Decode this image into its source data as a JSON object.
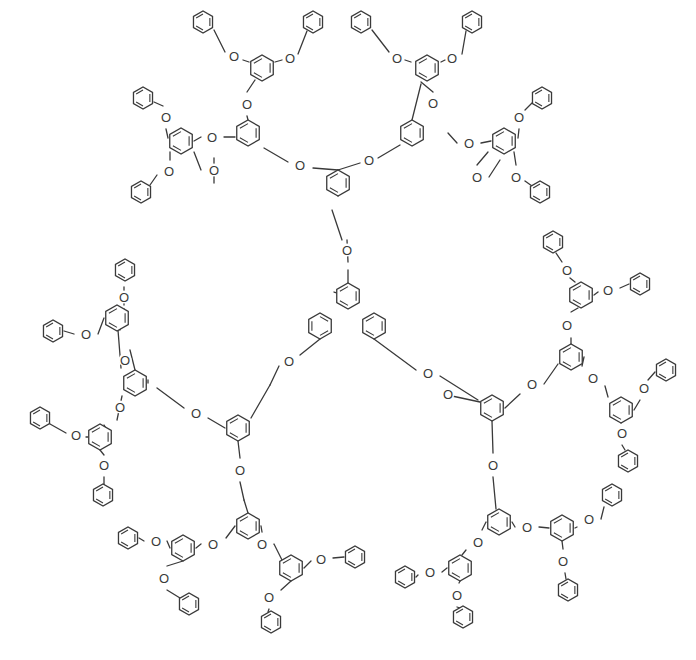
{
  "figure": {
    "type": "chemical-structure",
    "core": {
      "label": "",
      "methyl_tick": true
    },
    "atom_label": "O",
    "caption": "",
    "colors": {
      "line": "#3a3a3a",
      "background": "#ffffff"
    }
  },
  "rings": [
    {
      "id": "core1",
      "x": 348,
      "y": 296,
      "r": 13,
      "rot": 90
    },
    {
      "id": "core2",
      "x": 320,
      "y": 326,
      "r": 13,
      "rot": 30
    },
    {
      "id": "core3",
      "x": 374,
      "y": 326,
      "r": 13,
      "rot": -30
    },
    {
      "id": "G1a",
      "x": 338,
      "y": 183,
      "r": 13,
      "rot": 90
    },
    {
      "id": "G2a1",
      "x": 248,
      "y": 133,
      "r": 13,
      "rot": 90
    },
    {
      "id": "G2a2",
      "x": 412,
      "y": 133,
      "r": 13,
      "rot": 90
    },
    {
      "id": "G3a1",
      "x": 262,
      "y": 68,
      "r": 13,
      "rot": 90
    },
    {
      "id": "G3a2",
      "x": 181,
      "y": 141,
      "r": 13,
      "rot": 90
    },
    {
      "id": "G3a3",
      "x": 427,
      "y": 68,
      "r": 13,
      "rot": 90
    },
    {
      "id": "G3a4",
      "x": 504,
      "y": 141,
      "r": 13,
      "rot": 90
    },
    {
      "id": "Pa1",
      "x": 203,
      "y": 22,
      "r": 11,
      "rot": 90
    },
    {
      "id": "Pa2",
      "x": 313,
      "y": 22,
      "r": 11,
      "rot": 90
    },
    {
      "id": "Pa3",
      "x": 143,
      "y": 98,
      "r": 11,
      "rot": 90
    },
    {
      "id": "Pa4",
      "x": 141,
      "y": 192,
      "r": 11,
      "rot": 90
    },
    {
      "id": "Pa5",
      "x": 361,
      "y": 22,
      "r": 11,
      "rot": 90
    },
    {
      "id": "Pa6",
      "x": 472,
      "y": 22,
      "r": 11,
      "rot": 90
    },
    {
      "id": "Pa7",
      "x": 542,
      "y": 98,
      "r": 11,
      "rot": 90
    },
    {
      "id": "Pa8",
      "x": 540,
      "y": 192,
      "r": 11,
      "rot": 90
    },
    {
      "id": "G1b",
      "x": 238,
      "y": 428,
      "r": 13,
      "rot": 90
    },
    {
      "id": "G2b1",
      "x": 135,
      "y": 383,
      "r": 13,
      "rot": 90
    },
    {
      "id": "G2b2",
      "x": 248,
      "y": 526,
      "r": 13,
      "rot": 90
    },
    {
      "id": "G3b1",
      "x": 117,
      "y": 318,
      "r": 13,
      "rot": 90
    },
    {
      "id": "G3b2",
      "x": 100,
      "y": 437,
      "r": 13,
      "rot": 90
    },
    {
      "id": "G3b3",
      "x": 183,
      "y": 548,
      "r": 13,
      "rot": 90
    },
    {
      "id": "G3b4",
      "x": 291,
      "y": 568,
      "r": 13,
      "rot": 90
    },
    {
      "id": "Pb1",
      "x": 125,
      "y": 270,
      "r": 11,
      "rot": 90
    },
    {
      "id": "Pb2",
      "x": 53,
      "y": 331,
      "r": 11,
      "rot": 90
    },
    {
      "id": "Pb3",
      "x": 40,
      "y": 418,
      "r": 11,
      "rot": 90
    },
    {
      "id": "Pb4",
      "x": 103,
      "y": 495,
      "r": 11,
      "rot": 90
    },
    {
      "id": "Pb5",
      "x": 128,
      "y": 538,
      "r": 11,
      "rot": 90
    },
    {
      "id": "Pb6",
      "x": 189,
      "y": 604,
      "r": 11,
      "rot": 90
    },
    {
      "id": "Pb7",
      "x": 355,
      "y": 557,
      "r": 11,
      "rot": 90
    },
    {
      "id": "Pb8",
      "x": 271,
      "y": 622,
      "r": 11,
      "rot": 90
    },
    {
      "id": "G1c",
      "x": 492,
      "y": 408,
      "r": 13,
      "rot": 90
    },
    {
      "id": "G2c1",
      "x": 571,
      "y": 357,
      "r": 13,
      "rot": 90
    },
    {
      "id": "G2c2",
      "x": 499,
      "y": 522,
      "r": 13,
      "rot": 90
    },
    {
      "id": "G3c1",
      "x": 581,
      "y": 295,
      "r": 13,
      "rot": 90
    },
    {
      "id": "G3c2",
      "x": 621,
      "y": 410,
      "r": 13,
      "rot": 90
    },
    {
      "id": "G3c3",
      "x": 460,
      "y": 568,
      "r": 13,
      "rot": 90
    },
    {
      "id": "G3c4",
      "x": 562,
      "y": 528,
      "r": 13,
      "rot": 90
    },
    {
      "id": "Pc1",
      "x": 553,
      "y": 242,
      "r": 11,
      "rot": 90
    },
    {
      "id": "Pc2",
      "x": 640,
      "y": 284,
      "r": 11,
      "rot": 90
    },
    {
      "id": "Pc3",
      "x": 666,
      "y": 370,
      "r": 11,
      "rot": 90
    },
    {
      "id": "Pc4",
      "x": 628,
      "y": 461,
      "r": 11,
      "rot": 90
    },
    {
      "id": "Pc5",
      "x": 405,
      "y": 577,
      "r": 11,
      "rot": 90
    },
    {
      "id": "Pc6",
      "x": 463,
      "y": 617,
      "r": 11,
      "rot": 90
    },
    {
      "id": "Pc7",
      "x": 612,
      "y": 495,
      "r": 11,
      "rot": 90
    },
    {
      "id": "Pc8",
      "x": 568,
      "y": 590,
      "r": 11,
      "rot": 90
    }
  ],
  "oxygens": [
    {
      "x": 347,
      "y": 250
    },
    {
      "x": 289,
      "y": 361
    },
    {
      "x": 428,
      "y": 373
    },
    {
      "x": 300,
      "y": 165
    },
    {
      "x": 369,
      "y": 160
    },
    {
      "x": 247,
      "y": 104
    },
    {
      "x": 433,
      "y": 103
    },
    {
      "x": 212,
      "y": 137
    },
    {
      "x": 214,
      "y": 170
    },
    {
      "x": 469,
      "y": 143
    },
    {
      "x": 477,
      "y": 177
    },
    {
      "x": 234,
      "y": 56
    },
    {
      "x": 290,
      "y": 58
    },
    {
      "x": 166,
      "y": 117
    },
    {
      "x": 169,
      "y": 171
    },
    {
      "x": 397,
      "y": 58
    },
    {
      "x": 452,
      "y": 58
    },
    {
      "x": 519,
      "y": 117
    },
    {
      "x": 516,
      "y": 177
    },
    {
      "x": 196,
      "y": 413
    },
    {
      "x": 240,
      "y": 470
    },
    {
      "x": 125,
      "y": 360
    },
    {
      "x": 120,
      "y": 407
    },
    {
      "x": 213,
      "y": 544
    },
    {
      "x": 262,
      "y": 544
    },
    {
      "x": 124,
      "y": 297
    },
    {
      "x": 86,
      "y": 334
    },
    {
      "x": 76,
      "y": 435
    },
    {
      "x": 104,
      "y": 465
    },
    {
      "x": 156,
      "y": 541
    },
    {
      "x": 164,
      "y": 578
    },
    {
      "x": 321,
      "y": 559
    },
    {
      "x": 269,
      "y": 597
    },
    {
      "x": 448,
      "y": 394
    },
    {
      "x": 532,
      "y": 384
    },
    {
      "x": 493,
      "y": 465
    },
    {
      "x": 567,
      "y": 325
    },
    {
      "x": 593,
      "y": 378
    },
    {
      "x": 478,
      "y": 542
    },
    {
      "x": 527,
      "y": 527
    },
    {
      "x": 567,
      "y": 270
    },
    {
      "x": 608,
      "y": 290
    },
    {
      "x": 644,
      "y": 388
    },
    {
      "x": 622,
      "y": 433
    },
    {
      "x": 430,
      "y": 572
    },
    {
      "x": 457,
      "y": 595
    },
    {
      "x": 589,
      "y": 519
    },
    {
      "x": 563,
      "y": 561
    }
  ],
  "bonds": [
    [
      348,
      283,
      348,
      270
    ],
    [
      348,
      262,
      347,
      240
    ],
    [
      342,
      240,
      332,
      210
    ],
    [
      338,
      196,
      338,
      170
    ],
    [
      338,
      170,
      313,
      168
    ],
    [
      288,
      162,
      264,
      148
    ],
    [
      338,
      170,
      360,
      163
    ],
    [
      378,
      158,
      400,
      145
    ],
    [
      248,
      120,
      247,
      116
    ],
    [
      247,
      92,
      255,
      80
    ],
    [
      412,
      120,
      421,
      84
    ],
    [
      433,
      92,
      421,
      82
    ],
    [
      235,
      137,
      224,
      137
    ],
    [
      201,
      137,
      194,
      141
    ],
    [
      214,
      158,
      214,
      183
    ],
    [
      201,
      170,
      194,
      152
    ],
    [
      448,
      133,
      457,
      143
    ],
    [
      481,
      143,
      491,
      141
    ],
    [
      477,
      165,
      488,
      152
    ],
    [
      489,
      177,
      500,
      160
    ],
    [
      249,
      62,
      243,
      60
    ],
    [
      225,
      52,
      214,
      30
    ],
    [
      275,
      62,
      282,
      60
    ],
    [
      298,
      54,
      307,
      31
    ],
    [
      168,
      138,
      166,
      129
    ],
    [
      163,
      106,
      154,
      102
    ],
    [
      170,
      152,
      170,
      160
    ],
    [
      157,
      175,
      150,
      185
    ],
    [
      411,
      62,
      405,
      60
    ],
    [
      389,
      52,
      372,
      30
    ],
    [
      441,
      62,
      445,
      60
    ],
    [
      462,
      54,
      466,
      31
    ],
    [
      518,
      138,
      519,
      129
    ],
    [
      525,
      110,
      532,
      103
    ],
    [
      514,
      152,
      516,
      165
    ],
    [
      525,
      181,
      532,
      186
    ],
    [
      320,
      339,
      300,
      355
    ],
    [
      279,
      366,
      270,
      385
    ],
    [
      270,
      385,
      251,
      418
    ],
    [
      374,
      339,
      416,
      370
    ],
    [
      440,
      376,
      478,
      400
    ],
    [
      452,
      396,
      480,
      402
    ],
    [
      225,
      428,
      208,
      418
    ],
    [
      184,
      408,
      157,
      388
    ],
    [
      148,
      380,
      148,
      383
    ],
    [
      238,
      441,
      240,
      458
    ],
    [
      240,
      482,
      244,
      500
    ],
    [
      244,
      500,
      248,
      513
    ],
    [
      135,
      370,
      130,
      350
    ],
    [
      121,
      368,
      118,
      330
    ],
    [
      122,
      396,
      117,
      420
    ],
    [
      107,
      430,
      104,
      425
    ],
    [
      124,
      305,
      124,
      287
    ],
    [
      120,
      330,
      124,
      309
    ],
    [
      104,
      318,
      98,
      334
    ],
    [
      74,
      334,
      64,
      331
    ],
    [
      88,
      437,
      86,
      437
    ],
    [
      66,
      433,
      50,
      424
    ],
    [
      100,
      450,
      104,
      455
    ],
    [
      104,
      477,
      104,
      485
    ],
    [
      235,
      526,
      226,
      538
    ],
    [
      201,
      544,
      196,
      548
    ],
    [
      261,
      526,
      262,
      532
    ],
    [
      274,
      544,
      282,
      560
    ],
    [
      170,
      548,
      167,
      541
    ],
    [
      144,
      541,
      139,
      538
    ],
    [
      183,
      561,
      167,
      566
    ],
    [
      167,
      590,
      180,
      598
    ],
    [
      304,
      568,
      311,
      561
    ],
    [
      333,
      558,
      344,
      557
    ],
    [
      291,
      581,
      281,
      590
    ],
    [
      269,
      609,
      268,
      612
    ],
    [
      505,
      408,
      520,
      394
    ],
    [
      544,
      384,
      558,
      364
    ],
    [
      492,
      421,
      493,
      453
    ],
    [
      493,
      477,
      496,
      509
    ],
    [
      571,
      344,
      571,
      338
    ],
    [
      571,
      312,
      578,
      308
    ],
    [
      584,
      357,
      582,
      366
    ],
    [
      605,
      386,
      608,
      397
    ],
    [
      575,
      282,
      570,
      278
    ],
    [
      562,
      262,
      556,
      253
    ],
    [
      594,
      295,
      598,
      292
    ],
    [
      620,
      288,
      629,
      284
    ],
    [
      634,
      410,
      640,
      400
    ],
    [
      648,
      380,
      655,
      372
    ],
    [
      621,
      423,
      622,
      421
    ],
    [
      622,
      445,
      625,
      450
    ],
    [
      486,
      522,
      482,
      530
    ],
    [
      466,
      550,
      462,
      555
    ],
    [
      512,
      522,
      515,
      527
    ],
    [
      539,
      527,
      549,
      528
    ],
    [
      447,
      568,
      442,
      572
    ],
    [
      418,
      575,
      416,
      577
    ],
    [
      460,
      581,
      459,
      583
    ],
    [
      457,
      607,
      460,
      608
    ],
    [
      575,
      528,
      577,
      527
    ],
    [
      601,
      519,
      604,
      507
    ],
    [
      562,
      541,
      563,
      549
    ],
    [
      565,
      573,
      566,
      579
    ]
  ],
  "core_methyl": [
    348,
    296,
    334,
    292
  ]
}
